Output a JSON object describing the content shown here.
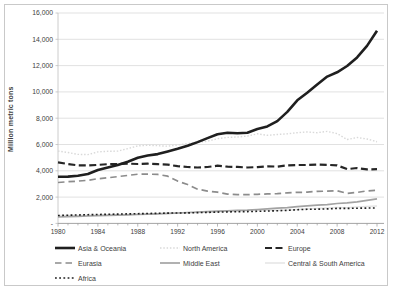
{
  "chart_data": {
    "type": "line",
    "title": "",
    "xlabel": "",
    "ylabel": "Million metric tons",
    "x_start": 1980,
    "x_end": 2012,
    "x_tick_labels": [
      "1980",
      "1984",
      "1988",
      "1992",
      "1996",
      "2000",
      "2004",
      "2008",
      "2012"
    ],
    "y_ticks": [
      0,
      2000,
      4000,
      6000,
      8000,
      10000,
      12000,
      14000,
      16000
    ],
    "y_tick_labels": [
      "-",
      "2,000",
      "4,000",
      "6,000",
      "8,000",
      "10,000",
      "12,000",
      "14,000",
      "16,000"
    ],
    "ylim": [
      0,
      16000
    ],
    "grid": "horizontal-only",
    "legend_position": "bottom",
    "colors": {
      "grid": "#d9d9d9",
      "axis": "#bfbfbf",
      "tick": "#9a9a9a",
      "label_text": "#404040"
    },
    "series": [
      {
        "name": "Asia & Oceania",
        "color": "#1f1f1f",
        "width": 2.6,
        "dash": "",
        "legend_col": 0,
        "legend_row": 0,
        "values": [
          3550,
          3560,
          3630,
          3760,
          4060,
          4260,
          4430,
          4690,
          4990,
          5160,
          5270,
          5470,
          5670,
          5900,
          6180,
          6490,
          6780,
          6890,
          6860,
          6900,
          7180,
          7380,
          7780,
          8480,
          9360,
          9940,
          10560,
          11160,
          11490,
          11970,
          12620,
          13500,
          14650
        ]
      },
      {
        "name": "North America",
        "color": "#d9d9d9",
        "width": 1.4,
        "dash": "1.5 1.8",
        "legend_col": 1,
        "legend_row": 0,
        "values": [
          5500,
          5390,
          5250,
          5230,
          5440,
          5480,
          5500,
          5690,
          5890,
          5950,
          5910,
          5870,
          5960,
          6070,
          6170,
          6250,
          6440,
          6540,
          6570,
          6640,
          6810,
          6700,
          6760,
          6810,
          6900,
          6960,
          6900,
          7000,
          6830,
          6380,
          6530,
          6420,
          6210
        ]
      },
      {
        "name": "Europe",
        "color": "#262626",
        "width": 2.2,
        "dash": "7 3.5",
        "legend_col": 2,
        "legend_row": 0,
        "values": [
          4650,
          4510,
          4420,
          4400,
          4450,
          4500,
          4510,
          4550,
          4520,
          4540,
          4500,
          4470,
          4350,
          4290,
          4250,
          4290,
          4390,
          4310,
          4300,
          4250,
          4280,
          4340,
          4320,
          4410,
          4440,
          4440,
          4470,
          4460,
          4410,
          4130,
          4210,
          4110,
          4120
        ]
      },
      {
        "name": "Eurasia",
        "color": "#8c8c8c",
        "width": 1.7,
        "dash": "6.5 4",
        "legend_col": 0,
        "legend_row": 1,
        "values": [
          3110,
          3170,
          3220,
          3280,
          3400,
          3470,
          3560,
          3650,
          3740,
          3750,
          3730,
          3590,
          3220,
          2960,
          2600,
          2460,
          2370,
          2230,
          2180,
          2190,
          2210,
          2240,
          2260,
          2330,
          2360,
          2370,
          2440,
          2450,
          2480,
          2280,
          2360,
          2470,
          2520
        ]
      },
      {
        "name": "Middle East",
        "color": "#a3a3a3",
        "width": 1.7,
        "dash": "",
        "legend_col": 1,
        "legend_row": 1,
        "values": [
          490,
          515,
          535,
          560,
          590,
          610,
          630,
          655,
          680,
          700,
          730,
          760,
          790,
          830,
          870,
          900,
          930,
          955,
          990,
          1010,
          1060,
          1100,
          1160,
          1200,
          1270,
          1340,
          1390,
          1430,
          1510,
          1570,
          1640,
          1750,
          1870
        ]
      },
      {
        "name": "Central & South America",
        "color": "#e2e2e2",
        "width": 1.4,
        "dash": "",
        "legend_col": 2,
        "legend_row": 1,
        "values": [
          600,
          605,
          610,
          615,
          630,
          645,
          670,
          690,
          710,
          720,
          730,
          750,
          765,
          785,
          820,
          850,
          890,
          935,
          965,
          970,
          990,
          1000,
          1005,
          1015,
          1060,
          1100,
          1140,
          1180,
          1220,
          1190,
          1255,
          1290,
          1320
        ]
      },
      {
        "name": "Africa",
        "color": "#1f1f1f",
        "width": 1.6,
        "dash": "1.8 2.4",
        "legend_col": 0,
        "legend_row": 2,
        "values": [
          600,
          620,
          640,
          660,
          680,
          695,
          705,
          720,
          740,
          755,
          770,
          780,
          790,
          800,
          820,
          840,
          860,
          875,
          890,
          900,
          920,
          940,
          960,
          1000,
          1040,
          1070,
          1080,
          1100,
          1140,
          1140,
          1155,
          1165,
          1180
        ]
      }
    ],
    "legend_layout": {
      "col_x": [
        55,
        160,
        265
      ],
      "row_y": [
        243,
        258,
        273
      ],
      "swatch_width": 20,
      "swatch_height": 8
    }
  }
}
